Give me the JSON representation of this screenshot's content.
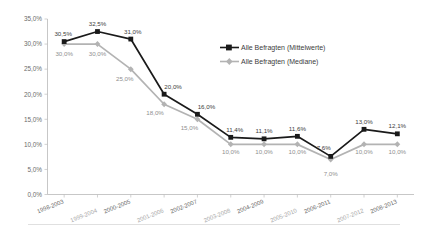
{
  "chart_data": {
    "type": "line",
    "title": "",
    "subtitle": "",
    "xlabel": "",
    "ylabel": "",
    "ylim": [
      0,
      35
    ],
    "ytick_labels": [
      "0,0%",
      "5,0%",
      "10,0%",
      "15,0%",
      "20,0%",
      "25,0%",
      "30,0%",
      "35,0%"
    ],
    "ytick_values": [
      0,
      5,
      10,
      15,
      20,
      25,
      30,
      35
    ],
    "grid": false,
    "legend_position": "upper-right-inside",
    "categories": [
      "1998-2003",
      "1999-2004",
      "2000-2005",
      "2001-2006",
      "2002-2007",
      "2003-2008",
      "2004-2009",
      "2005-2010",
      "2006-2011",
      "2007-2012",
      "2008-2013"
    ],
    "series": [
      {
        "name": "Alle Befragten (Mittelwerte)",
        "color": "#1a1a1a",
        "marker": "square",
        "values": [
          30.5,
          32.5,
          31.0,
          20.0,
          16.0,
          11.4,
          11.1,
          11.6,
          7.6,
          13.0,
          12.1
        ],
        "data_labels": [
          "30,5%",
          "32,5%",
          "31,0%",
          "20,0%",
          "16,0%",
          "11,4%",
          "11,1%",
          "11,6%",
          "7,6%",
          "13,0%",
          "12,1%"
        ]
      },
      {
        "name": "Alle Befragten (Mediane)",
        "color": "#b3b3b3",
        "marker": "diamond",
        "values": [
          30.0,
          30.0,
          25.0,
          18.0,
          15.0,
          10.0,
          10.0,
          10.0,
          7.0,
          10.0,
          10.0
        ],
        "data_labels": [
          "30,0%",
          "30,0%",
          "25,0%",
          "18,0%",
          "15,0%",
          "10,0%",
          "10,0%",
          "10,0%",
          "7,0%",
          "10,0%",
          "10,0%"
        ]
      }
    ]
  },
  "legend": {
    "items": [
      {
        "label": "Alle Befragten (Mittelwerte)"
      },
      {
        "label": "Alle Befragten (Mediane)"
      }
    ]
  }
}
